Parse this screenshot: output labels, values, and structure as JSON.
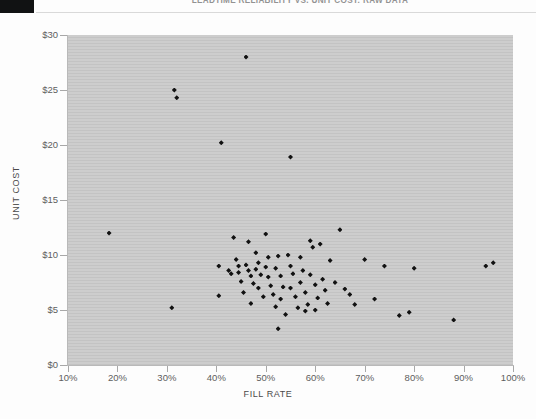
{
  "document": {
    "header_title": "LEADTIME RELIABILITY VS. UNIT COST: RAW DATA"
  },
  "chart_data": {
    "type": "scatter",
    "title": "",
    "xlabel": "FILL RATE",
    "ylabel": "UNIT COST",
    "xlim": [
      10,
      100
    ],
    "ylim": [
      0,
      30
    ],
    "xticks": [
      "10%",
      "20%",
      "30%",
      "40%",
      "50%",
      "60%",
      "70%",
      "80%",
      "90%",
      "100%"
    ],
    "xtick_values": [
      10,
      20,
      30,
      40,
      50,
      60,
      70,
      80,
      90,
      100
    ],
    "yticks": [
      "$0",
      "$5",
      "$10",
      "$15",
      "$20",
      "$25",
      "$30"
    ],
    "ytick_values": [
      0,
      5,
      10,
      15,
      20,
      25,
      30
    ],
    "grid": false,
    "legend": "none",
    "marker": "diamond",
    "marker_color": "#111111",
    "plot_background": "#cdcdcd",
    "points": [
      [
        18.3,
        12.0
      ],
      [
        31.5,
        25.0
      ],
      [
        32.0,
        24.3
      ],
      [
        31.0,
        5.2
      ],
      [
        40.5,
        9.0
      ],
      [
        41.0,
        20.2
      ],
      [
        40.5,
        6.3
      ],
      [
        43.5,
        11.6
      ],
      [
        44.0,
        9.6
      ],
      [
        43.0,
        8.3
      ],
      [
        44.5,
        8.4
      ],
      [
        45.0,
        7.6
      ],
      [
        45.5,
        6.6
      ],
      [
        46.0,
        28.0
      ],
      [
        46.5,
        11.2
      ],
      [
        46.0,
        9.1
      ],
      [
        46.5,
        8.6
      ],
      [
        47.0,
        8.1
      ],
      [
        47.5,
        7.4
      ],
      [
        47.0,
        5.6
      ],
      [
        48.0,
        10.2
      ],
      [
        48.5,
        9.3
      ],
      [
        48.0,
        8.7
      ],
      [
        49.0,
        8.2
      ],
      [
        48.5,
        7.0
      ],
      [
        49.5,
        6.2
      ],
      [
        50.0,
        11.9
      ],
      [
        50.5,
        9.8
      ],
      [
        50.0,
        8.9
      ],
      [
        50.5,
        8.0
      ],
      [
        51.0,
        7.2
      ],
      [
        51.5,
        6.4
      ],
      [
        52.0,
        5.3
      ],
      [
        52.5,
        9.9
      ],
      [
        52.0,
        8.8
      ],
      [
        53.0,
        8.1
      ],
      [
        53.5,
        7.1
      ],
      [
        53.0,
        6.0
      ],
      [
        54.0,
        4.6
      ],
      [
        54.5,
        10.0
      ],
      [
        55.0,
        18.9
      ],
      [
        55.0,
        9.0
      ],
      [
        55.5,
        8.3
      ],
      [
        55.0,
        7.0
      ],
      [
        56.0,
        6.2
      ],
      [
        56.5,
        5.2
      ],
      [
        57.0,
        9.8
      ],
      [
        57.5,
        8.6
      ],
      [
        57.0,
        7.5
      ],
      [
        58.0,
        6.6
      ],
      [
        58.5,
        5.5
      ],
      [
        58.0,
        4.9
      ],
      [
        59.0,
        11.3
      ],
      [
        59.5,
        10.7
      ],
      [
        59.0,
        8.2
      ],
      [
        60.0,
        7.3
      ],
      [
        60.5,
        6.1
      ],
      [
        60.0,
        5.0
      ],
      [
        61.0,
        11.0
      ],
      [
        61.5,
        7.8
      ],
      [
        62.0,
        6.8
      ],
      [
        62.5,
        5.6
      ],
      [
        63.0,
        9.5
      ],
      [
        64.0,
        7.5
      ],
      [
        65.0,
        12.3
      ],
      [
        66.0,
        6.9
      ],
      [
        67.0,
        6.4
      ],
      [
        68.0,
        5.5
      ],
      [
        70.0,
        9.6
      ],
      [
        72.0,
        6.0
      ],
      [
        74.0,
        9.0
      ],
      [
        77.0,
        4.5
      ],
      [
        79.0,
        4.8
      ],
      [
        80.0,
        8.8
      ],
      [
        88.0,
        4.1
      ],
      [
        94.5,
        9.0
      ],
      [
        96.0,
        9.3
      ],
      [
        52.5,
        3.3
      ],
      [
        44.5,
        9.0
      ],
      [
        42.5,
        8.6
      ]
    ]
  }
}
